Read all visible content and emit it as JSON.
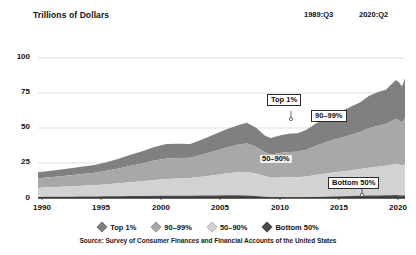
{
  "header": {
    "axis_title": "Trillions of Dollars",
    "period_start": "1989:Q3",
    "period_end": "2020:Q2"
  },
  "source": "Source: Survey of Consumer Finances and Financial Accounts of the United States",
  "callouts": {
    "top1": "Top 1%",
    "p90_99": "90–99%",
    "p50_90": "50–90%",
    "bottom50": "Bottom 50%"
  },
  "colors": {
    "top1": "#808080",
    "p90_99": "#a8a8a8",
    "p50_90": "#d2d2d2",
    "bottom50": "#4a4a4a",
    "grid": "#cfcfcf",
    "axis": "#333333",
    "text": "#111111"
  },
  "chart_data": {
    "type": "area",
    "title": "Trillions of Dollars",
    "xlabel": "",
    "ylabel": "Trillions of Dollars",
    "xlim": [
      1989.75,
      2020.5
    ],
    "ylim": [
      0,
      108
    ],
    "yticks": [
      0,
      25,
      50,
      75,
      100
    ],
    "xticks": [
      1990,
      1995,
      2000,
      2005,
      2010,
      2015,
      2020
    ],
    "grid": true,
    "stacked": true,
    "legend_position": "bottom",
    "legend": [
      "Top 1%",
      "90–99%",
      "50–90%",
      "Bottom 50%"
    ],
    "x": [
      1989.75,
      1990.5,
      1991.5,
      1992.5,
      1993.5,
      1994.5,
      1995.5,
      1996.5,
      1997.5,
      1998.5,
      1999.5,
      2000.5,
      2001.5,
      2002.5,
      2003.5,
      2004.5,
      2005.5,
      2006.5,
      2007.25,
      2008.0,
      2008.75,
      2009.25,
      2010.0,
      2010.75,
      2011.5,
      2012.25,
      2013.0,
      2013.75,
      2014.5,
      2015.25,
      2016.0,
      2016.75,
      2017.5,
      2018.25,
      2018.9,
      2019.25,
      2019.75,
      2020.0,
      2020.25,
      2020.5
    ],
    "series": [
      {
        "name": "Bottom 50%",
        "values": [
          0.8,
          0.9,
          0.9,
          1.0,
          1.1,
          1.2,
          1.3,
          1.4,
          1.5,
          1.6,
          1.7,
          1.8,
          1.8,
          1.8,
          1.9,
          2.0,
          2.1,
          2.1,
          2.0,
          1.6,
          1.0,
          0.6,
          0.5,
          0.4,
          0.4,
          0.5,
          0.7,
          0.9,
          1.1,
          1.3,
          1.5,
          1.7,
          1.9,
          2.0,
          2.1,
          2.2,
          2.3,
          2.2,
          1.9,
          2.1
        ]
      },
      {
        "name": "50–90%",
        "values": [
          7.0,
          7.3,
          7.6,
          8.0,
          8.4,
          8.7,
          9.3,
          9.9,
          10.6,
          11.3,
          12.1,
          12.8,
          13.2,
          13.6,
          14.5,
          15.6,
          16.8,
          17.7,
          18.1,
          17.3,
          15.9,
          15.1,
          15.4,
          15.6,
          15.6,
          16.1,
          17.1,
          17.9,
          18.6,
          19.2,
          19.9,
          20.6,
          21.5,
          22.2,
          22.7,
          23.2,
          23.9,
          23.5,
          23.1,
          24.4
        ]
      },
      {
        "name": "90–99%",
        "values": [
          7.4,
          7.7,
          8.1,
          8.6,
          9.1,
          9.5,
          10.4,
          11.5,
          12.7,
          13.8,
          15.1,
          15.9,
          15.9,
          15.6,
          17.0,
          18.4,
          19.9,
          21.2,
          22.0,
          20.6,
          18.4,
          17.9,
          18.9,
          19.5,
          19.6,
          20.6,
          22.4,
          23.9,
          25.2,
          26.2,
          27.4,
          28.7,
          30.6,
          31.6,
          32.2,
          33.4,
          35.0,
          34.3,
          33.1,
          35.3
        ]
      },
      {
        "name": "Top 1%",
        "values": [
          4.6,
          4.8,
          5.1,
          5.4,
          5.7,
          6.0,
          6.6,
          7.5,
          8.5,
          9.4,
          10.5,
          11.1,
          11.0,
          10.6,
          11.8,
          12.9,
          14.1,
          15.2,
          15.9,
          14.8,
          13.0,
          12.6,
          13.5,
          14.1,
          14.3,
          15.4,
          17.1,
          18.5,
          19.7,
          20.6,
          21.7,
          22.9,
          24.8,
          25.9,
          26.6,
          28.0,
          29.9,
          29.2,
          27.9,
          30.5
        ]
      }
    ],
    "totals_note": "Stacked total household wealth; peak just above 100 trillion in 2020:Q1"
  }
}
